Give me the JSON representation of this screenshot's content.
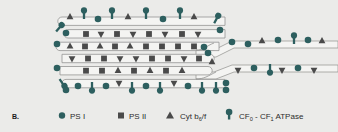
{
  "figure": {
    "panel_letter": "B.",
    "background_color": "#ebebe9",
    "psi_color": "#2d5f5f",
    "psii_color": "#4a4a4a",
    "cyt_color": "#4a4a4a",
    "atpase_color": "#2d5f5f",
    "membrane_color": "#9a9a98",
    "membrane_fill": "#f4f4f2"
  },
  "legend": {
    "items": [
      {
        "icon": "circle-marker",
        "label": "PS I",
        "color": "#2d5f5f"
      },
      {
        "icon": "square-marker",
        "label": "PS II",
        "color": "#4a4a4a"
      },
      {
        "icon": "triangle-marker",
        "label_main": "Cyt b",
        "label_sub": "6",
        "label_mid": "/f",
        "label": "Cyt b6/f",
        "color": "#4a4a4a"
      },
      {
        "icon": "atpase-marker",
        "label_pre": "CF",
        "sub_0": "0",
        "label_mid": " - CF",
        "sub_1": "1",
        "label_post": " ATPase",
        "label": "CF0 - CF1 ATPase",
        "color": "#2d5f5f"
      }
    ]
  },
  "diagram": {
    "regions": [
      {
        "name": "grana-stack",
        "complexes": [
          "PS II",
          "Cyt b6/f",
          "PS I",
          "CF0-CF1 ATPase"
        ]
      },
      {
        "name": "stroma-lamellae",
        "complexes": [
          "PS I",
          "Cyt b6/f",
          "CF0-CF1 ATPase"
        ]
      }
    ],
    "membranes": [
      {
        "id": "m1",
        "type": "grana-top",
        "y": 21,
        "top_markers": [
          "cyt",
          "atpase",
          "psi",
          "atpase",
          "cyt",
          "atpase",
          "psi",
          "atpase",
          "cyt",
          "atpase"
        ],
        "bottom_markers": []
      },
      {
        "id": "m2",
        "type": "grana",
        "y": 34,
        "top_markers": [],
        "bottom_markers": [
          "psii",
          "cyt",
          "psii",
          "cyt",
          "psii",
          "cyt",
          "psii"
        ]
      },
      {
        "id": "m3",
        "type": "grana",
        "y": 46,
        "top_markers": [
          "cyt",
          "psii",
          "cyt",
          "psii",
          "cyt",
          "psii",
          "psii",
          "psii",
          "psii"
        ],
        "bottom_markers": []
      },
      {
        "id": "m4",
        "type": "grana",
        "y": 58,
        "top_markers": [
          "cyt",
          "psii",
          "psii",
          "cyt",
          "cyt",
          "psii",
          "psii",
          "cyt",
          "psii"
        ],
        "bottom_markers": []
      },
      {
        "id": "m5",
        "type": "grana",
        "y": 71,
        "top_markers": [
          "psii",
          "psii",
          "cyt",
          "psii",
          "cyt",
          "psii",
          "cyt"
        ],
        "bottom_markers": []
      },
      {
        "id": "m6",
        "type": "grana-bottom",
        "y": 84,
        "top_markers": [
          "psi",
          "atpase",
          "psi",
          "cyt",
          "atpase",
          "psi",
          "atpase",
          "cyt",
          "psi",
          "atpase",
          "atpase"
        ],
        "bottom_markers": []
      },
      {
        "id": "s1",
        "type": "stroma-upper",
        "y": 50,
        "top_markers": [
          "psi",
          "psi",
          "cyt",
          "psi",
          "atpase",
          "psi",
          "cyt"
        ],
        "bottom_markers": []
      },
      {
        "id": "s2",
        "type": "stroma-lower",
        "y": 74,
        "top_markers": [
          "cyt",
          "psi",
          "atpase",
          "cyt",
          "psi",
          "cyt"
        ],
        "bottom_markers": []
      }
    ]
  }
}
